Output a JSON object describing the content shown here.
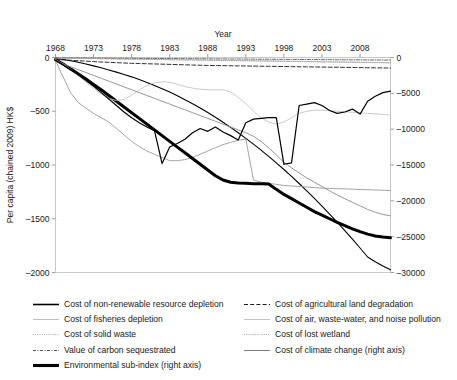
{
  "chart_data": {
    "type": "line",
    "title": "",
    "xlabel": "Year",
    "ylabel": "Per capita (chained 2009) HK$",
    "ylabel_right": "",
    "xlim": [
      1968,
      2012
    ],
    "ylim": [
      -2000,
      0
    ],
    "ylim_right": [
      -30000,
      0
    ],
    "grid": false,
    "legend_position": "below",
    "xticks": [
      1968,
      1973,
      1978,
      1983,
      1988,
      1993,
      1998,
      2003,
      2008
    ],
    "yticks": [
      0,
      -500,
      -1000,
      -1500,
      -2000
    ],
    "yticks_right": [
      0,
      -5000,
      -10000,
      -15000,
      -20000,
      -25000,
      -30000
    ],
    "x": [
      1968,
      1969,
      1970,
      1971,
      1972,
      1973,
      1974,
      1975,
      1976,
      1977,
      1978,
      1979,
      1980,
      1981,
      1982,
      1983,
      1984,
      1985,
      1986,
      1987,
      1988,
      1989,
      1990,
      1991,
      1992,
      1993,
      1994,
      1995,
      1996,
      1997,
      1998,
      1999,
      2000,
      2001,
      2002,
      2003,
      2004,
      2005,
      2006,
      2007,
      2008,
      2009,
      2010,
      2011,
      2012
    ],
    "series": [
      {
        "name": "Cost of non-renewable resource depletion",
        "axis": "left",
        "style": "solid",
        "color": "#000000",
        "width": 1.1,
        "values": [
          -8,
          -18,
          -30,
          -44,
          -60,
          -78,
          -96,
          -116,
          -136,
          -158,
          -180,
          -205,
          -232,
          -260,
          -290,
          -322,
          -356,
          -392,
          -430,
          -470,
          -512,
          -556,
          -602,
          -650,
          -700,
          -752,
          -806,
          -862,
          -920,
          -980,
          -1042,
          -1106,
          -1172,
          -1240,
          -1310,
          -1382,
          -1456,
          -1532,
          -1610,
          -1690,
          -1772,
          -1856,
          -1900,
          -1940,
          -1975
        ]
      },
      {
        "name": "Cost of fisheries depletion",
        "axis": "left",
        "style": "solid",
        "color": "#9a9a9a",
        "width": 0.9,
        "values": [
          -30,
          -180,
          -330,
          -420,
          -470,
          -520,
          -560,
          -600,
          -660,
          -720,
          -780,
          -830,
          -870,
          -900,
          -930,
          -960,
          -960,
          -950,
          -930,
          -900,
          -870,
          -840,
          -810,
          -790,
          -770,
          -760,
          -1140,
          -1160,
          -1170,
          -1180,
          -1190,
          -1195,
          -1200,
          -1205,
          -1210,
          -1215,
          -1218,
          -1220,
          -1222,
          -1225,
          -1228,
          -1230,
          -1232,
          -1235,
          -1238
        ]
      },
      {
        "name": "Cost of solid waste",
        "axis": "left",
        "style": "dotted",
        "color": "#b0b0b0",
        "width": 0.9,
        "values": [
          -4,
          -5,
          -6,
          -7,
          -8,
          -9,
          -10,
          -11,
          -12,
          -13,
          -14,
          -15,
          -16,
          -17,
          -18,
          -19,
          -20,
          -21,
          -22,
          -23,
          -24,
          -25,
          -26,
          -27,
          -28,
          -29,
          -30,
          -31,
          -32,
          -33,
          -34,
          -35,
          -36,
          -37,
          -38,
          -39,
          -40,
          -41,
          -42,
          -43,
          -44,
          -45,
          -46,
          -47,
          -48
        ]
      },
      {
        "name": "Value of carbon sequestrated",
        "axis": "left",
        "style": "dashdot",
        "color": "#555555",
        "width": 0.9,
        "values": [
          -2,
          -3,
          -3,
          -4,
          -4,
          -5,
          -5,
          -6,
          -6,
          -7,
          -7,
          -8,
          -8,
          -9,
          -9,
          -10,
          -10,
          -11,
          -11,
          -12,
          -12,
          -13,
          -13,
          -14,
          -14,
          -15,
          -15,
          -16,
          -16,
          -17,
          -17,
          -18,
          -18,
          -19,
          -19,
          -20,
          -20,
          -21,
          -21,
          -22,
          -22,
          -23,
          -23,
          -24,
          -24
        ]
      },
      {
        "name": "Environmental sub-index (right axis)",
        "axis": "right",
        "style": "solid",
        "color": "#000000",
        "width": 3.0,
        "values": [
          -300,
          -900,
          -1600,
          -2300,
          -3000,
          -3750,
          -4500,
          -5300,
          -6100,
          -6900,
          -7700,
          -8500,
          -9300,
          -10100,
          -10900,
          -11700,
          -12500,
          -13300,
          -14100,
          -14900,
          -15700,
          -16500,
          -17100,
          -17400,
          -17500,
          -17550,
          -17600,
          -17620,
          -17640,
          -18400,
          -19100,
          -19700,
          -20300,
          -20900,
          -21500,
          -22000,
          -22500,
          -23000,
          -23450,
          -23900,
          -24300,
          -24650,
          -24900,
          -25050,
          -25150
        ]
      },
      {
        "name": "Cost of agricultural land degradation",
        "axis": "left",
        "style": "dashed",
        "color": "#1a1a1a",
        "width": 0.9,
        "values": [
          -18,
          -22,
          -26,
          -30,
          -34,
          -38,
          -42,
          -45,
          -48,
          -51,
          -54,
          -56,
          -58,
          -60,
          -62,
          -64,
          -66,
          -68,
          -70,
          -72,
          -74,
          -75,
          -76,
          -77,
          -78,
          -79,
          -80,
          -81,
          -82,
          -83,
          -84,
          -85,
          -86,
          -87,
          -88,
          -89,
          -90,
          -91,
          -92,
          -93,
          -94,
          -95,
          -96,
          -97,
          -98
        ]
      },
      {
        "name": "Cost of air, waste-water, and noise pollution",
        "axis": "left",
        "style": "solid",
        "color": "#c4c4c4",
        "width": 0.9,
        "values": [
          -20,
          -60,
          -110,
          -170,
          -230,
          -290,
          -340,
          -380,
          -400,
          -390,
          -350,
          -300,
          -260,
          -235,
          -225,
          -230,
          -250,
          -270,
          -285,
          -295,
          -300,
          -300,
          -300,
          -320,
          -370,
          -430,
          -500,
          -560,
          -600,
          -620,
          -600,
          -560,
          -520,
          -500,
          -490,
          -490,
          -495,
          -500,
          -505,
          -510,
          -515,
          -520,
          -525,
          -530,
          -535
        ]
      },
      {
        "name": "Cost of lost wetland",
        "axis": "left",
        "style": "dotted",
        "color": "#a8a8a8",
        "width": 0.9,
        "values": [
          -6,
          -7,
          -8,
          -9,
          -10,
          -11,
          -12,
          -13,
          -14,
          -15,
          -16,
          -17,
          -18,
          -19,
          -20,
          -21,
          -22,
          -23,
          -24,
          -25,
          -26,
          -27,
          -28,
          -29,
          -30,
          -31,
          -32,
          -33,
          -34,
          -35,
          -36,
          -37,
          -38,
          -39,
          -40,
          -41,
          -42,
          -43,
          -44,
          -45,
          -46,
          -47,
          -48,
          -49,
          -50
        ]
      },
      {
        "name": "Cost of climate change (right axis)",
        "axis": "right",
        "style": "solid",
        "color": "#8a8a8a",
        "width": 0.9,
        "values": [
          -500,
          -900,
          -1300,
          -1700,
          -2100,
          -2500,
          -2900,
          -3300,
          -3700,
          -4100,
          -4500,
          -4900,
          -5300,
          -5700,
          -6100,
          -6500,
          -6900,
          -7300,
          -7700,
          -8100,
          -8500,
          -8900,
          -9300,
          -9700,
          -10100,
          -10500,
          -11000,
          -11700,
          -12600,
          -13600,
          -14600,
          -15400,
          -16100,
          -16800,
          -17400,
          -18000,
          -18600,
          -19200,
          -19700,
          -20200,
          -20700,
          -21200,
          -21600,
          -21900,
          -22100
        ]
      },
      {
        "name": "Cost of non-renewable resource depletion (right axis trace)",
        "axis": "right",
        "style": "solid",
        "color": "#000000",
        "width": 1.2,
        "values": [
          -380,
          -1000,
          -1700,
          -2400,
          -3200,
          -4000,
          -4900,
          -5800,
          -6700,
          -7600,
          -8400,
          -9100,
          -9700,
          -10200,
          -14800,
          -12500,
          -12000,
          -11400,
          -10500,
          -9900,
          -10300,
          -9700,
          -10400,
          -10900,
          -11500,
          -9100,
          -8600,
          -8500,
          -8400,
          -8400,
          -14900,
          -14700,
          -6700,
          -6500,
          -6300,
          -6700,
          -7400,
          -7800,
          -7600,
          -7200,
          -7900,
          -6100,
          -5400,
          -4900,
          -4700
        ]
      }
    ]
  },
  "legend": {
    "left_column": [
      {
        "label": "Cost of non-renewable resource depletion",
        "style": "solid-thick",
        "color": "#000000"
      },
      {
        "label": "Cost of fisheries depletion",
        "style": "solid-thin",
        "color": "#b5b5b5"
      },
      {
        "label": "Cost of solid waste",
        "style": "dotted",
        "color": "#b0b0b0"
      },
      {
        "label": "Value of carbon sequestrated",
        "style": "dashdot",
        "color": "#555555"
      },
      {
        "label": "Environmental sub-index (right axis)",
        "style": "solid-extra-thick",
        "color": "#000000"
      }
    ],
    "right_column": [
      {
        "label": "Cost of agricultural land degradation",
        "style": "dashed",
        "color": "#1a1a1a"
      },
      {
        "label": "Cost of air, waste-water, and noise pollution",
        "style": "solid-thin",
        "color": "#bdbdbd"
      },
      {
        "label": "Cost of lost wetland",
        "style": "dotted",
        "color": "#a8a8a8"
      },
      {
        "label": "Cost of climate change (right axis)",
        "style": "solid-thin",
        "color": "#6f6f6f"
      }
    ]
  }
}
